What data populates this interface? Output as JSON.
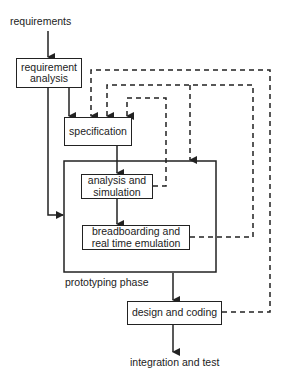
{
  "diagram": {
    "type": "process-flow",
    "nodes": {
      "requirements": "requirements",
      "requirement_analysis": "requirement\nanalysis",
      "specification": "specification",
      "prototyping_phase": "prototyping phase",
      "analysis_simulation": "analysis and\nsimulation",
      "breadboarding": "breadboarding and\nreal time emulation",
      "design_coding": "design and coding",
      "integration_test": "integration and test"
    },
    "edges": [
      {
        "from": "requirements",
        "to": "requirement_analysis",
        "style": "solid"
      },
      {
        "from": "requirement_analysis",
        "to": "specification",
        "style": "solid"
      },
      {
        "from": "requirement_analysis",
        "to": "prototyping_phase",
        "style": "solid"
      },
      {
        "from": "specification",
        "to": "analysis_simulation",
        "style": "solid"
      },
      {
        "from": "analysis_simulation",
        "to": "breadboarding",
        "style": "solid"
      },
      {
        "from": "prototyping_phase",
        "to": "design_coding",
        "style": "solid"
      },
      {
        "from": "design_coding",
        "to": "integration_test",
        "style": "solid"
      },
      {
        "from": "requirement_analysis",
        "to": "specification",
        "style": "dashed"
      },
      {
        "from": "analysis_simulation",
        "to": "specification",
        "style": "dashed"
      },
      {
        "from": "breadboarding",
        "to": "specification",
        "style": "dashed"
      },
      {
        "from": "breadboarding",
        "to": "prototyping_phase",
        "style": "dashed"
      },
      {
        "from": "design_coding",
        "to": "requirement_analysis",
        "style": "dashed"
      }
    ],
    "colors": {
      "line": "#222222",
      "background": "#ffffff"
    }
  }
}
